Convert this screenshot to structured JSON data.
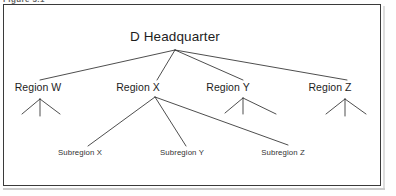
{
  "figure": {
    "caption_clipped": "Figure 3.1",
    "frame_color": "#3a3a3a",
    "line_color": "#2e2e2e",
    "background": "#ffffff"
  },
  "diagram": {
    "type": "organization-tree",
    "root": {
      "label": "D Headquarter",
      "x": 175,
      "y": 36
    },
    "apex": {
      "x": 175,
      "y": 50
    },
    "regions": [
      {
        "id": "w",
        "label": "Region W",
        "x": 38,
        "y": 88,
        "apex_x": 40,
        "apex_y": 99,
        "has_stubs": true
      },
      {
        "id": "x",
        "label": "Region X",
        "x": 138,
        "y": 88,
        "apex_x": 155,
        "apex_y": 97,
        "has_stubs": false
      },
      {
        "id": "y",
        "label": "Region Y",
        "x": 228,
        "y": 88,
        "apex_x": 243,
        "apex_y": 98,
        "has_stubs": true
      },
      {
        "id": "z",
        "label": "Region Z",
        "x": 330,
        "y": 88,
        "apex_x": 345,
        "apex_y": 99,
        "has_stubs": true
      }
    ],
    "subregions": [
      {
        "id": "sub-x",
        "label": "Subregion X",
        "x": 80,
        "y": 152,
        "tip_x": 88,
        "tip_y": 146
      },
      {
        "id": "sub-y",
        "label": "Subregion Y",
        "x": 182,
        "y": 152,
        "tip_x": 186,
        "tip_y": 146
      },
      {
        "id": "sub-z",
        "label": "Subregion Z",
        "x": 283,
        "y": 152,
        "tip_x": 288,
        "tip_y": 145
      }
    ]
  }
}
